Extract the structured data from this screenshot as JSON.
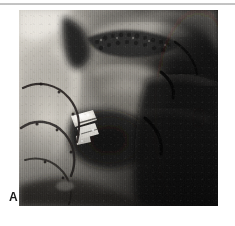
{
  "page": {
    "background_color": "#ffffff",
    "width": 235,
    "height": 226
  },
  "rule": {
    "name": "top-horizontal-rule",
    "color": "#b3b3b3"
  },
  "figure": {
    "panel_label": "A",
    "label_color": "#1a1a1a",
    "caption": "",
    "photo": {
      "type": "grayscale-photograph",
      "subject": "intraoperative surgical photograph",
      "frame": {
        "left": 19,
        "top": 10,
        "width": 199,
        "height": 196
      },
      "palette": {
        "highlight": "#f2f0ec",
        "light_tissue": "#c8c4bd",
        "mid_tissue": "#8d8a84",
        "shadow_tissue": "#4a4845",
        "deep_shadow": "#1d1c1b",
        "black": "#080808",
        "instrument_white": "#fbfaf6"
      },
      "regions": [
        {
          "name": "upper-left-bright-tissue",
          "tone": "#dedad2"
        },
        {
          "name": "left-pale-tissue-flap",
          "tone": "#b9b5ad"
        },
        {
          "name": "dark-cleft-upper-center",
          "tone": "#121110"
        },
        {
          "name": "granular-suture-band",
          "tone": "#3b3936"
        },
        {
          "name": "central-tissue-fold",
          "tone": "#6f6c66"
        },
        {
          "name": "metallic-clip-instrument",
          "tone": "#fbfaf6"
        },
        {
          "name": "dark-cavity-lower-center",
          "tone": "#171615"
        },
        {
          "name": "right-dark-field",
          "tone": "#0c0b0b"
        },
        {
          "name": "lower-right-black-field",
          "tone": "#070707"
        }
      ],
      "markings": [
        {
          "name": "suture-line-left-upper",
          "tone": "#262422"
        },
        {
          "name": "suture-line-left-lower",
          "tone": "#2a2825"
        },
        {
          "name": "tissue-crease-right-upper",
          "tone": "#050505"
        },
        {
          "name": "tissue-crease-right-lower",
          "tone": "#050505"
        }
      ]
    }
  }
}
